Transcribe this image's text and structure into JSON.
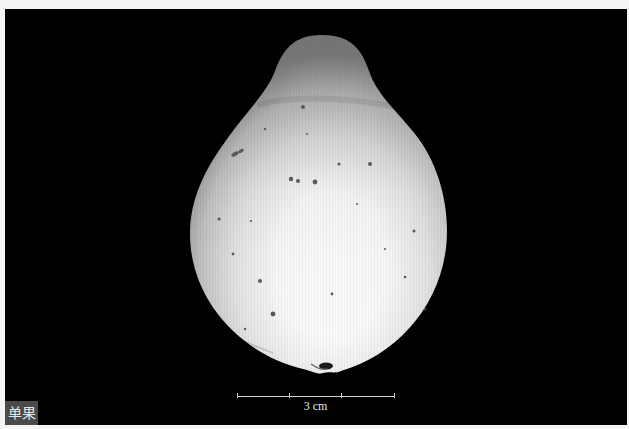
{
  "image": {
    "subject": "single fruit specimen on black background",
    "label": "单果",
    "background_color": "#000000",
    "frame_color": "#f4f4f4"
  },
  "scale_bar": {
    "label": "3 cm",
    "divisions": 3,
    "color": "#d0d0d0"
  },
  "colors": {
    "label_box_bg": "#4a4a4a",
    "label_text": "#e8e8e8",
    "fruit_highlight": "#ffffff",
    "fruit_shadow": "#9a9a9a",
    "speckle": "#5a5a5a"
  }
}
